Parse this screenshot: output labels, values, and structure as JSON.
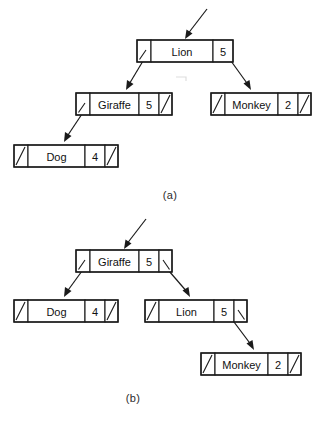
{
  "figure": {
    "background_color": "#ffffff",
    "ink_color": "#1a1a1a"
  },
  "panels": [
    {
      "id": "panel-a",
      "caption": "(a)",
      "root_arrow_label": "root-pointer-arrow",
      "nodes": [
        {
          "id": "a-lion",
          "key": "Lion",
          "value": "5",
          "left_null": false,
          "right_null": false,
          "x": 137,
          "y": 40,
          "w": 96,
          "h": 22,
          "left_cell_w": 14,
          "value_cell_w": 20,
          "right_cell_w": 0
        },
        {
          "id": "a-giraffe",
          "key": "Giraffe",
          "value": "5",
          "left_null": false,
          "right_null": true,
          "x": 76,
          "y": 93,
          "w": 96,
          "h": 22,
          "left_cell_w": 14,
          "value_cell_w": 20,
          "right_cell_w": 13
        },
        {
          "id": "a-monkey",
          "key": "Monkey",
          "value": "2",
          "left_null": true,
          "right_null": true,
          "x": 211,
          "y": 93,
          "w": 96,
          "h": 22,
          "left_cell_w": 14,
          "value_cell_w": 20,
          "right_cell_w": 13
        },
        {
          "id": "a-dog",
          "key": "Dog",
          "value": "4",
          "left_null": true,
          "right_null": true,
          "x": 14,
          "y": 145,
          "w": 96,
          "h": 22,
          "left_cell_w": 14,
          "value_cell_w": 20,
          "right_cell_w": 13
        }
      ],
      "edges": [
        {
          "from": "a-lion",
          "side": "left",
          "to": "a-giraffe"
        },
        {
          "from": "a-lion",
          "side": "right",
          "to": "a-monkey"
        },
        {
          "from": "a-giraffe",
          "side": "left",
          "to": "a-dog"
        }
      ]
    },
    {
      "id": "panel-b",
      "caption": "(b)",
      "root_arrow_label": "root-pointer-arrow",
      "nodes": [
        {
          "id": "b-giraffe",
          "key": "Giraffe",
          "value": "5",
          "left_null": false,
          "right_null": false,
          "x": 76,
          "y": 250,
          "w": 96,
          "h": 22,
          "left_cell_w": 14,
          "value_cell_w": 20,
          "right_cell_w": 13
        },
        {
          "id": "b-dog",
          "key": "Dog",
          "value": "4",
          "left_null": true,
          "right_null": true,
          "x": 14,
          "y": 300,
          "w": 96,
          "h": 22,
          "left_cell_w": 14,
          "value_cell_w": 20,
          "right_cell_w": 13
        },
        {
          "id": "b-lion",
          "key": "Lion",
          "value": "5",
          "left_null": true,
          "right_null": false,
          "x": 145,
          "y": 300,
          "w": 96,
          "h": 22,
          "left_cell_w": 14,
          "value_cell_w": 20,
          "right_cell_w": 13
        },
        {
          "id": "b-monkey",
          "key": "Monkey",
          "value": "2",
          "left_null": true,
          "right_null": true,
          "x": 201,
          "y": 353,
          "w": 96,
          "h": 22,
          "left_cell_w": 14,
          "value_cell_w": 20,
          "right_cell_w": 13
        }
      ],
      "edges": [
        {
          "from": "b-giraffe",
          "side": "left",
          "to": "b-dog"
        },
        {
          "from": "b-giraffe",
          "side": "right",
          "to": "b-lion"
        },
        {
          "from": "b-lion",
          "side": "right",
          "to": "b-monkey"
        }
      ]
    }
  ],
  "captions": {
    "a": "(a)",
    "b": "(b)"
  },
  "node_labels": {
    "lion": "Lion",
    "giraffe": "Giraffe",
    "monkey": "Monkey",
    "dog": "Dog"
  },
  "node_values": {
    "lion_a": "5",
    "giraffe_a": "5",
    "monkey_a": "2",
    "dog_a": "4",
    "giraffe_b": "5",
    "dog_b": "4",
    "lion_b": "5",
    "monkey_b": "2"
  }
}
